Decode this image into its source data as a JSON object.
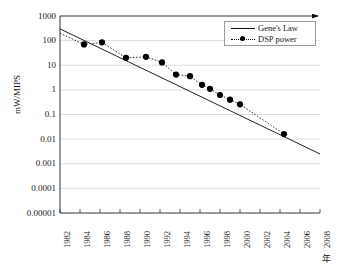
{
  "figure": {
    "ylabel": "mW/MIPS",
    "xunit": "年"
  },
  "legend": {
    "items": [
      {
        "label": "Gene's Law",
        "style": "solid-line",
        "color": "#111111"
      },
      {
        "label": "DSP power",
        "style": "dotted-line-with-marker",
        "color": "#000000"
      }
    ]
  },
  "chart_data": {
    "type": "line",
    "title": "",
    "xlabel": "年",
    "ylabel": "mW/MIPS",
    "xlim": [
      1982,
      2008
    ],
    "ylim": [
      1e-05,
      1000
    ],
    "yscale": "log",
    "grid": true,
    "legend_position": "top-right",
    "xticks": [
      "1982",
      "1984",
      "1986",
      "1988",
      "1990",
      "1992",
      "1994",
      "1996",
      "1998",
      "2000",
      "2002",
      "2004",
      "2006",
      "2008"
    ],
    "yticks": [
      "1000",
      "100",
      "10",
      "1",
      "0.1",
      "0.01",
      "0.001",
      "0.0001",
      "0.00001"
    ],
    "series": [
      {
        "name": "Gene's Law",
        "type": "line",
        "style": "solid",
        "x": [
          1982,
          2008
        ],
        "y": [
          300,
          0.0025
        ]
      },
      {
        "name": "DSP power",
        "type": "line-markers",
        "style": "dotted",
        "marker": "filled-circle",
        "x": [
          1982,
          1984.4,
          1986.2,
          1988.6,
          1990.6,
          1992.2,
          1993.6,
          1995.0,
          1996.2,
          1997.0,
          1998.0,
          1999.0,
          2000.0,
          2004.4
        ],
        "y": [
          200,
          70,
          85,
          20,
          22,
          13,
          4.2,
          3.6,
          1.6,
          1.1,
          0.62,
          0.4,
          0.26,
          0.016
        ]
      }
    ]
  }
}
